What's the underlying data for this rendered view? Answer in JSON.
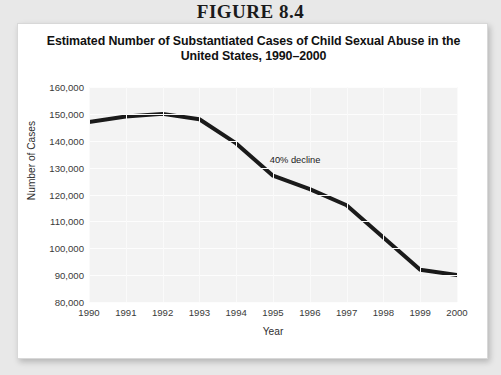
{
  "figure": {
    "header": "FIGURE 8.4"
  },
  "chart_data": {
    "type": "line",
    "title": "Estimated Number of Substantiated Cases of Child Sexual Abuse in the United States, 1990–2000",
    "title_line1": "Estimated Number of Substantiated Cases of Child Sexual Abuse in the",
    "title_line2": "United States, 1990–2000",
    "xlabel": "Year",
    "ylabel": "Number of Cases",
    "categories": [
      "1990",
      "1991",
      "1992",
      "1993",
      "1994",
      "1995",
      "1996",
      "1997",
      "1998",
      "1999",
      "2000"
    ],
    "x": [
      1990,
      1991,
      1992,
      1993,
      1994,
      1995,
      1996,
      1997,
      1998,
      1999,
      2000
    ],
    "values": [
      147000,
      149000,
      150000,
      148000,
      139000,
      127000,
      122000,
      116000,
      104000,
      92000,
      90000
    ],
    "ylim": [
      80000,
      160000
    ],
    "xlim": [
      1990,
      2000
    ],
    "yticks": [
      160000,
      150000,
      140000,
      130000,
      120000,
      110000,
      100000,
      90000,
      80000
    ],
    "ytick_labels": [
      "160,000",
      "150,000",
      "140,000",
      "130,000",
      "120,000",
      "110,000",
      "100,000",
      "90,000",
      "80,000"
    ],
    "xtick_labels": [
      "1990",
      "1991",
      "1992",
      "1993",
      "1994",
      "1995",
      "1996",
      "1997",
      "1998",
      "1999",
      "2000"
    ],
    "grid": true,
    "legend": "none",
    "line_color": "#1a1a1a",
    "line_width": 4,
    "plot_background": "#f3f3f3",
    "annotations": [
      {
        "text": "40% decline",
        "x": 1995.6,
        "y": 133000
      }
    ]
  }
}
